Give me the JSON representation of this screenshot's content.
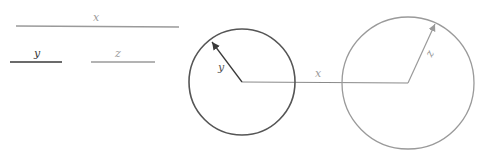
{
  "legend": {
    "x": {
      "label": "x",
      "color": "#9a9a9a"
    },
    "y": {
      "label": "y",
      "color": "#3a3a3a"
    },
    "z": {
      "label": "z",
      "color": "#9a9a9a"
    }
  },
  "diagram": {
    "left_circle": {
      "radius_label": "y",
      "color": "#555555"
    },
    "connector": {
      "label": "x",
      "color": "#8a8a8a"
    },
    "right_circle": {
      "radius_label": "z",
      "color": "#9a9a9a"
    }
  }
}
